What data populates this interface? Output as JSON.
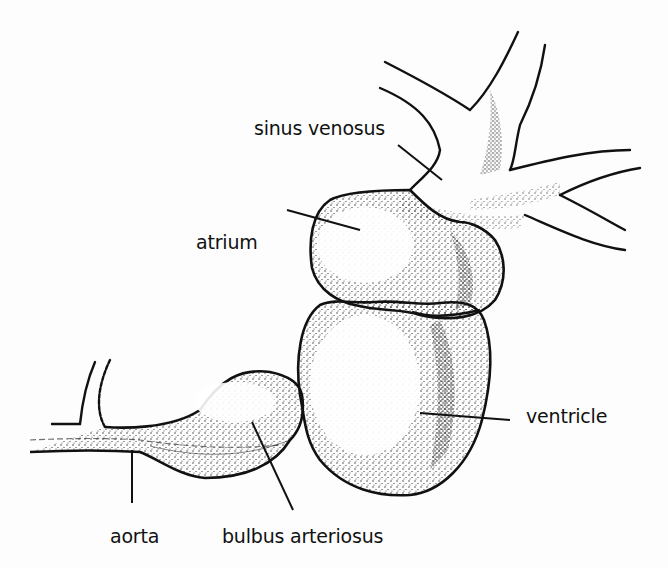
{
  "diagram": {
    "type": "labeled anatomical illustration",
    "labels": {
      "sinus_venosus": "sinus venosus",
      "atrium": "atrium",
      "ventricle": "ventricle",
      "aorta": "aorta",
      "bulbus_arteriosus": "bulbus arteriosus"
    },
    "colors": {
      "ink": "#111111",
      "background": "#fdfdfd",
      "stipple": "#222222"
    }
  }
}
